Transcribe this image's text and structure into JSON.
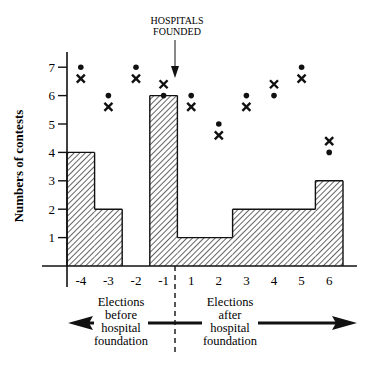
{
  "chart_data": {
    "type": "bar",
    "subtype": "step-histogram with overlaid scatter markers",
    "title": "",
    "xlabel": "",
    "ylabel": "Numbers of contests",
    "ylim": [
      0,
      7.5
    ],
    "yticks": [
      1,
      2,
      3,
      4,
      5,
      6,
      7
    ],
    "grid": false,
    "categories": [
      "-4",
      "-3",
      "-2",
      "-1",
      "1",
      "2",
      "3",
      "4",
      "5",
      "6"
    ],
    "series": [
      {
        "name": "Contests (hatched bars)",
        "marker": "bar-hatched",
        "values": [
          4,
          2,
          0,
          6,
          1,
          1,
          2,
          2,
          2,
          3
        ]
      },
      {
        "name": "Dot markers",
        "marker": "dot",
        "values": [
          7,
          6,
          7,
          6,
          6,
          5,
          6,
          6,
          7,
          4
        ]
      },
      {
        "name": "X markers",
        "marker": "x",
        "values": [
          6.6,
          5.6,
          6.6,
          6.4,
          5.6,
          4.6,
          5.6,
          6.4,
          6.6,
          4.4
        ]
      }
    ],
    "annotations": [
      {
        "text": "HOSPITALS FOUNDED",
        "position": "top, arrow pointing down between -1 and 1"
      },
      {
        "text": "Elections before hospital foundation",
        "position": "bottom left, arrow pointing left"
      },
      {
        "text": "Elections after hospital foundation",
        "position": "bottom right, arrow pointing right"
      }
    ],
    "divider": {
      "style": "dashed vertical",
      "position": "between -1 and 1"
    }
  },
  "labels": {
    "ylabel": "Numbers of contests",
    "yticks": [
      "1",
      "2",
      "3",
      "4",
      "5",
      "6",
      "7"
    ],
    "xticks": [
      "-4",
      "-3",
      "-2",
      "-1",
      "1",
      "2",
      "3",
      "4",
      "5",
      "6"
    ],
    "hospitals_line1": "HOSPITALS",
    "hospitals_line2": "FOUNDED",
    "before": [
      "Elections",
      "before",
      "hospital",
      "foundation"
    ],
    "after": [
      "Elections",
      "after",
      "hospital",
      "foundation"
    ]
  }
}
